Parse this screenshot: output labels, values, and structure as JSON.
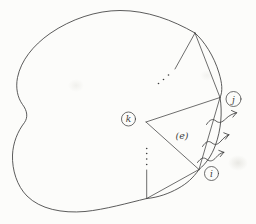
{
  "colors": {
    "paper": "#fcfcfa",
    "ink": "#3e3e3e"
  },
  "diagram": {
    "kind": "domain-boundary-triangulation-figure",
    "vertex_labels": {
      "k": "k",
      "j": "j",
      "i": "i"
    },
    "element_label": "(e)",
    "flux_arrow_count": 3,
    "ellipsis_dot_groups": 2
  }
}
